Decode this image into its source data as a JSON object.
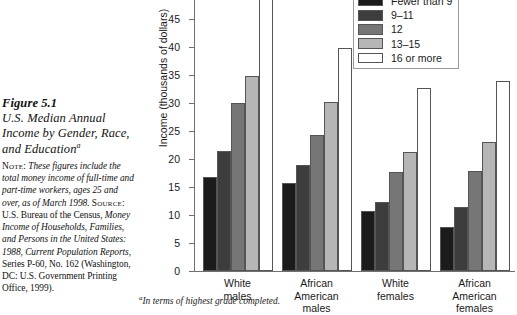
{
  "caption": {
    "figure_number": "Figure 5.1",
    "title": "U.S. Median Annual Income by Gender, Race, and Education",
    "title_superscript": "a",
    "note_label": "Note:",
    "note_text_1": "These figures include the total money income of full-time and part-time workers, ages 25 and over, as of March 1998.",
    "source_label": "Source:",
    "source_text_1": "U.S. Bureau of the Census, ",
    "source_italic_1": "Money Income of Households, Families, and Persons in the United States: 1988, Current Population Reports",
    "source_text_2": ", Series P-60, No. 162 (Washington, DC: U.S. Government Printing Office, 1999)."
  },
  "footnote": {
    "marker": "a",
    "text": "In terms of highest grade completed."
  },
  "chart_data": {
    "type": "bar",
    "title": "U.S. Median Annual Income by Gender, Race, and Education",
    "xlabel": "",
    "ylabel": "Income (thousands of dollars)",
    "ylim": [
      0,
      50
    ],
    "ytick_step": 5,
    "yticks": [
      0,
      5,
      10,
      15,
      20,
      25,
      30,
      35,
      40,
      45,
      50
    ],
    "ytick_labels": [
      "0",
      "5",
      "10",
      "15",
      "20",
      "25",
      "30",
      "35",
      "40",
      "45",
      "50"
    ],
    "grid": false,
    "legend_position": "top-right",
    "legend_title": "",
    "categories": [
      "White males",
      "African American males",
      "White females",
      "African American females"
    ],
    "category_label_lines": [
      [
        "White",
        "males"
      ],
      [
        "African",
        "American",
        "males"
      ],
      [
        "White",
        "females"
      ],
      [
        "African",
        "American",
        "females"
      ]
    ],
    "series": [
      {
        "name": "Fewer than 9",
        "color": "#1b1b1b",
        "values": [
          16.7,
          15.8,
          10.7,
          7.8
        ]
      },
      {
        "name": "9–11",
        "color": "#3d3d3d",
        "values": [
          21.5,
          19.0,
          12.4,
          11.5
        ]
      },
      {
        "name": "12",
        "color": "#767676",
        "values": [
          30.0,
          24.2,
          17.6,
          17.8
        ]
      },
      {
        "name": "13–15",
        "color": "#b6b6b6",
        "values": [
          34.9,
          30.1,
          21.3,
          23.1
        ]
      },
      {
        "name": "16 or more",
        "color": "#ffffff",
        "values": [
          50.8,
          39.8,
          32.6,
          34.0
        ]
      }
    ]
  }
}
